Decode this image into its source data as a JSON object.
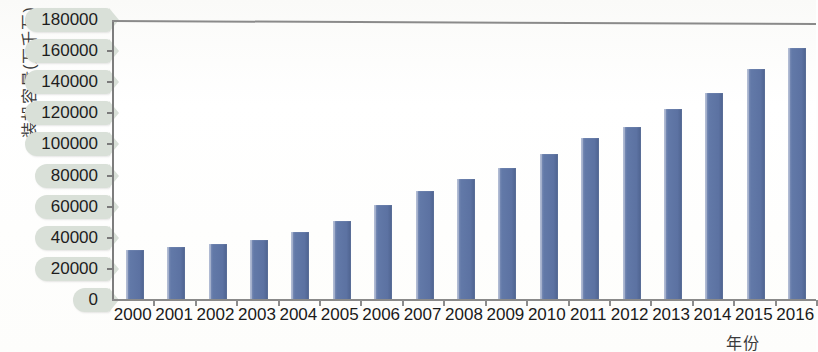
{
  "chart_data": {
    "type": "bar",
    "title": "",
    "xlabel": "年份",
    "ylabel": "装机容量(万千瓦)",
    "categories": [
      "2000",
      "2001",
      "2002",
      "2003",
      "2004",
      "2005",
      "2006",
      "2007",
      "2008",
      "2009",
      "2010",
      "2011",
      "2012",
      "2013",
      "2014",
      "2015",
      "2016"
    ],
    "values": [
      32000,
      33800,
      36000,
      38900,
      44000,
      50800,
      61000,
      70000,
      77800,
      85000,
      94000,
      104000,
      111000,
      123000,
      133000,
      148500,
      162000
    ],
    "ylim": [
      0,
      180000
    ],
    "yticks": [
      0,
      20000,
      40000,
      60000,
      80000,
      100000,
      120000,
      140000,
      160000,
      180000
    ],
    "ytick_labels": [
      "0",
      "20000",
      "40000",
      "60000",
      "80000",
      "100000",
      "120000",
      "140000",
      "160000",
      "180000"
    ],
    "grid": false,
    "legend": false,
    "bar_color": "#5c72a2",
    "axis_color": "#8a8a8a",
    "ylabel_pill_color": "#d9e0d8"
  },
  "axis": {
    "y_title": "装机容量(万千瓦)",
    "x_title": "年份"
  }
}
